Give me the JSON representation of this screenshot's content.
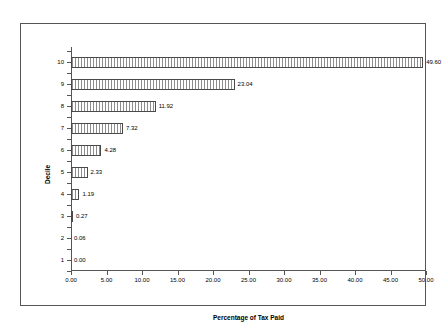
{
  "chart_data": {
    "type": "bar",
    "orientation": "horizontal",
    "title": "",
    "xlabel": "Percentage of Tax Paid",
    "ylabel": "Decile",
    "categories": [
      "1",
      "2",
      "3",
      "4",
      "5",
      "6",
      "7",
      "8",
      "9",
      "10"
    ],
    "values": [
      0.0,
      0.06,
      0.27,
      1.19,
      2.33,
      4.28,
      7.32,
      11.92,
      23.04,
      49.6
    ],
    "data_labels": [
      "0.00",
      "0.06",
      "0.27",
      "1.19",
      "2.33",
      "4.28",
      "7.32",
      "11.92",
      "23.04",
      "49.60"
    ],
    "xlim": [
      0,
      50
    ],
    "xticks": [
      0,
      5,
      10,
      15,
      20,
      25,
      30,
      35,
      40,
      45,
      50
    ],
    "xtick_labels": [
      "0.00",
      "5.00",
      "10.00",
      "15.00",
      "20.00",
      "25.00",
      "30.00",
      "35.00",
      "40.00",
      "45.00",
      "50.00"
    ],
    "grid": false,
    "legend": false,
    "series": [
      {
        "name": "Percentage of Tax Paid",
        "values": [
          0.0,
          0.06,
          0.27,
          1.19,
          2.33,
          4.28,
          7.32,
          11.92,
          23.04,
          49.6
        ]
      }
    ],
    "colors": {
      "bar_fill": "#ffffff",
      "bar_hatch": "#8d8d8d",
      "bar_border": "#4a4a4a",
      "axis": "#555555",
      "frame": "#555555",
      "text": "#000000",
      "background": "#ffffff"
    }
  }
}
